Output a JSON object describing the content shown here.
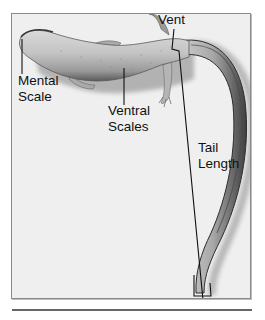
{
  "figure": {
    "labels": {
      "vent": "Vent",
      "mental_scale_line1": "Mental",
      "mental_scale_line2": "Scale",
      "ventral_scales_line1": "Ventral",
      "ventral_scales_line2": "Scales",
      "tail_length_line1": "Tail",
      "tail_length_line2": "Length"
    },
    "colors": {
      "frame_border": "#8a8a8a",
      "frame_background": "#efefef",
      "label_text": "#111111",
      "leader_line": "#111111",
      "separator": "#666666"
    }
  }
}
